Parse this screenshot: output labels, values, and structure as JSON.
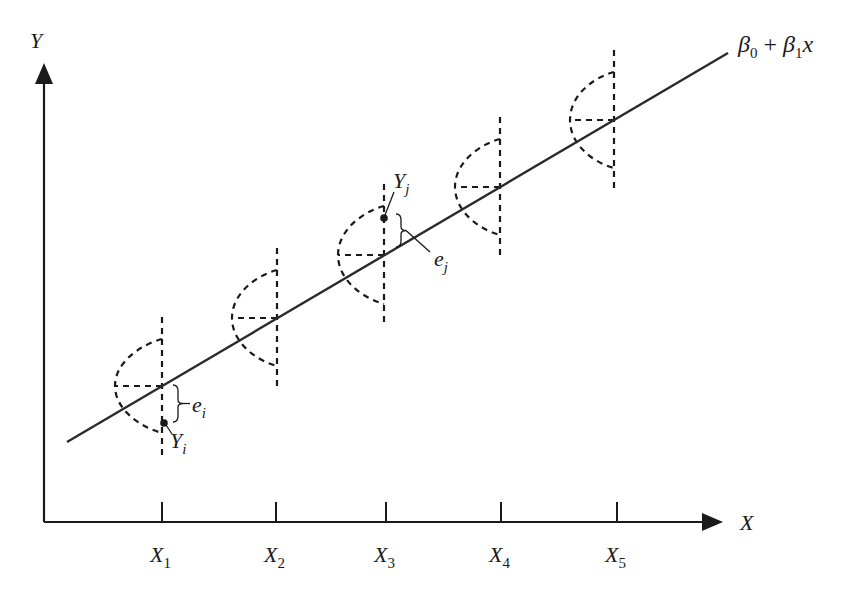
{
  "diagram": {
    "y_axis": {
      "label": "Y",
      "x": 44,
      "top": 63,
      "bottom": 522
    },
    "x_axis": {
      "label": "X",
      "y": 522,
      "left": 44,
      "right": 723
    },
    "regression_line": {
      "label_main": "β",
      "label_parts": [
        "β",
        "0",
        " + ",
        "β",
        "1",
        "x"
      ],
      "start": [
        67,
        442
      ],
      "end": [
        728,
        53
      ]
    },
    "ticks": [
      {
        "label": "X",
        "sub": "1",
        "x": 162
      },
      {
        "label": "X",
        "sub": "2",
        "x": 276
      },
      {
        "label": "X",
        "sub": "3",
        "x": 386
      },
      {
        "label": "X",
        "sub": "4",
        "x": 501
      },
      {
        "label": "X",
        "sub": "5",
        "x": 617
      }
    ],
    "distributions": [
      {
        "x": 162,
        "center_y": 386,
        "top": 317,
        "bottom": 458,
        "spread": 47
      },
      {
        "x": 277,
        "center_y": 318,
        "top": 248,
        "bottom": 390,
        "spread": 45
      },
      {
        "x": 384,
        "center_y": 255,
        "top": 184,
        "bottom": 323,
        "spread": 46
      },
      {
        "x": 500,
        "center_y": 187,
        "top": 117,
        "bottom": 258,
        "spread": 45
      },
      {
        "x": 614,
        "center_y": 120,
        "top": 50,
        "bottom": 192,
        "spread": 44
      }
    ],
    "observations": [
      {
        "name": "Yi",
        "label": "Y",
        "sub": "i",
        "point": [
          164,
          423
        ],
        "label_pos": [
          170,
          448
        ],
        "residual_label": "e",
        "residual_sub": "i",
        "brace_x": 176,
        "brace_top": 385,
        "brace_bottom": 422,
        "residual_pos": [
          192,
          412
        ]
      },
      {
        "name": "Yj",
        "label": "Y",
        "sub": "j",
        "point": [
          384,
          218
        ],
        "label_pos": [
          393,
          188
        ],
        "residual_label": "e",
        "residual_sub": "j",
        "brace_x": 399,
        "brace_top": 214,
        "brace_bottom": 247,
        "residual_pos": [
          434,
          266
        ]
      }
    ],
    "colors": {
      "ink": "#1a1a1a",
      "background": "#ffffff"
    }
  }
}
